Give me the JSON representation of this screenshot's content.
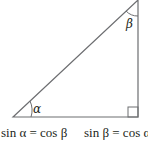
{
  "diagram": {
    "type": "right-triangle",
    "angles": {
      "alpha": {
        "label": "α",
        "position": "bottom-left"
      },
      "beta": {
        "label": "β",
        "position": "top-right"
      },
      "right_angle": {
        "position": "bottom-right"
      }
    },
    "equations": [
      {
        "text": "sin α = cos β"
      },
      {
        "text": "sin β = cos α"
      }
    ],
    "colors": {
      "line": "#6d6e71",
      "text": "#231f20",
      "background": "#ffffff"
    }
  }
}
